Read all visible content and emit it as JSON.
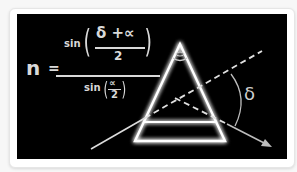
{
  "formula": {
    "lhs": "n",
    "equals": "=",
    "numerator": {
      "func": "sin",
      "paren_open": "(",
      "top": "δ +∝",
      "bottom": "2",
      "paren_close": ")"
    },
    "denominator": {
      "func": "sin",
      "paren_open": "(",
      "top": "∝",
      "bottom": "2",
      "paren_close": ")"
    }
  },
  "diagram": {
    "apex_angle_symbol": "∝",
    "deviation_label": "δ",
    "colors": {
      "background": "#000000",
      "prism_stroke": "#ffffff",
      "ray_stroke": "#dcdcdc",
      "arrow_stroke": "#bdbdbd"
    }
  }
}
